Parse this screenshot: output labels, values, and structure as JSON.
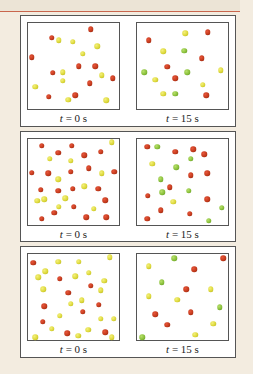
{
  "figure": {
    "rows": [
      {
        "left": {
          "label_var": "t",
          "label_rest": " = 0 s",
          "particles": [
            {
              "c": "red",
              "x": 69,
              "y": 7
            },
            {
              "c": "red",
              "x": 26,
              "y": 17
            },
            {
              "c": "yellow",
              "x": 34,
              "y": 20
            },
            {
              "c": "yellow",
              "x": 49,
              "y": 22
            },
            {
              "c": "yellow",
              "x": 76,
              "y": 27
            },
            {
              "c": "red",
              "x": 4,
              "y": 40
            },
            {
              "c": "yellow",
              "x": 60,
              "y": 36
            },
            {
              "c": "red",
              "x": 56,
              "y": 50
            },
            {
              "c": "red",
              "x": 74,
              "y": 50
            },
            {
              "c": "red",
              "x": 27,
              "y": 58
            },
            {
              "c": "yellow",
              "x": 38,
              "y": 57
            },
            {
              "c": "yellow",
              "x": 81,
              "y": 61
            },
            {
              "c": "red",
              "x": 93,
              "y": 64
            },
            {
              "c": "yellow",
              "x": 38,
              "y": 67
            },
            {
              "c": "yellow",
              "x": 8,
              "y": 74
            },
            {
              "c": "red",
              "x": 68,
              "y": 70
            },
            {
              "c": "red",
              "x": 23,
              "y": 86
            },
            {
              "c": "red",
              "x": 52,
              "y": 84
            },
            {
              "c": "yellow",
              "x": 44,
              "y": 89
            },
            {
              "c": "yellow",
              "x": 86,
              "y": 90
            }
          ]
        },
        "right": {
          "label_var": "t",
          "label_rest": " = 15 s",
          "particles": [
            {
              "c": "yellow",
              "x": 53,
              "y": 12
            },
            {
              "c": "red",
              "x": 78,
              "y": 11
            },
            {
              "c": "red",
              "x": 13,
              "y": 20
            },
            {
              "c": "yellow",
              "x": 29,
              "y": 33
            },
            {
              "c": "green",
              "x": 52,
              "y": 32
            },
            {
              "c": "red",
              "x": 71,
              "y": 41
            },
            {
              "c": "red",
              "x": 33,
              "y": 51
            },
            {
              "c": "green",
              "x": 8,
              "y": 57
            },
            {
              "c": "green",
              "x": 55,
              "y": 57
            },
            {
              "c": "yellow",
              "x": 92,
              "y": 55
            },
            {
              "c": "yellow",
              "x": 20,
              "y": 66
            },
            {
              "c": "red",
              "x": 42,
              "y": 64
            },
            {
              "c": "yellow",
              "x": 72,
              "y": 72
            },
            {
              "c": "yellow",
              "x": 29,
              "y": 82
            },
            {
              "c": "green",
              "x": 42,
              "y": 82
            },
            {
              "c": "red",
              "x": 76,
              "y": 84
            }
          ]
        }
      },
      {
        "left": {
          "label_var": "t",
          "label_rest": " = 0 s",
          "particles": [
            {
              "c": "red",
              "x": 15,
              "y": 8
            },
            {
              "c": "red",
              "x": 48,
              "y": 8
            },
            {
              "c": "yellow",
              "x": 92,
              "y": 4
            },
            {
              "c": "red",
              "x": 33,
              "y": 16
            },
            {
              "c": "red",
              "x": 62,
              "y": 19
            },
            {
              "c": "red",
              "x": 80,
              "y": 15
            },
            {
              "c": "yellow",
              "x": 24,
              "y": 23
            },
            {
              "c": "yellow",
              "x": 47,
              "y": 25
            },
            {
              "c": "red",
              "x": 4,
              "y": 39
            },
            {
              "c": "red",
              "x": 22,
              "y": 40
            },
            {
              "c": "red",
              "x": 67,
              "y": 34
            },
            {
              "c": "red",
              "x": 47,
              "y": 38
            },
            {
              "c": "red",
              "x": 95,
              "y": 38
            },
            {
              "c": "yellow",
              "x": 33,
              "y": 47
            },
            {
              "c": "yellow",
              "x": 81,
              "y": 40
            },
            {
              "c": "red",
              "x": 14,
              "y": 59
            },
            {
              "c": "red",
              "x": 33,
              "y": 60
            },
            {
              "c": "red",
              "x": 49,
              "y": 58
            },
            {
              "c": "yellow",
              "x": 62,
              "y": 55
            },
            {
              "c": "red",
              "x": 77,
              "y": 58
            },
            {
              "c": "yellow",
              "x": 10,
              "y": 72
            },
            {
              "c": "yellow",
              "x": 18,
              "y": 70
            },
            {
              "c": "yellow",
              "x": 41,
              "y": 69
            },
            {
              "c": "red",
              "x": 85,
              "y": 71
            },
            {
              "c": "yellow",
              "x": 34,
              "y": 79
            },
            {
              "c": "red",
              "x": 50,
              "y": 79
            },
            {
              "c": "red",
              "x": 29,
              "y": 86
            },
            {
              "c": "yellow",
              "x": 72,
              "y": 81
            },
            {
              "c": "red",
              "x": 15,
              "y": 93
            },
            {
              "c": "red",
              "x": 64,
              "y": 91
            },
            {
              "c": "red",
              "x": 86,
              "y": 91
            }
          ]
        },
        "right": {
          "label_var": "t",
          "label_rest": " = 15 s",
          "particles": [
            {
              "c": "red",
              "x": 11,
              "y": 9
            },
            {
              "c": "green",
              "x": 22,
              "y": 9
            },
            {
              "c": "red",
              "x": 42,
              "y": 15
            },
            {
              "c": "red",
              "x": 62,
              "y": 12
            },
            {
              "c": "red",
              "x": 74,
              "y": 18
            },
            {
              "c": "green",
              "x": 59,
              "y": 23
            },
            {
              "c": "yellow",
              "x": 17,
              "y": 29
            },
            {
              "c": "green",
              "x": 43,
              "y": 33
            },
            {
              "c": "red",
              "x": 59,
              "y": 42
            },
            {
              "c": "red",
              "x": 77,
              "y": 40
            },
            {
              "c": "green",
              "x": 26,
              "y": 47
            },
            {
              "c": "red",
              "x": 36,
              "y": 56
            },
            {
              "c": "red",
              "x": 12,
              "y": 66
            },
            {
              "c": "green",
              "x": 28,
              "y": 62
            },
            {
              "c": "green",
              "x": 57,
              "y": 60
            },
            {
              "c": "yellow",
              "x": 40,
              "y": 73
            },
            {
              "c": "red",
              "x": 77,
              "y": 70
            },
            {
              "c": "red",
              "x": 26,
              "y": 83
            },
            {
              "c": "green",
              "x": 93,
              "y": 80
            },
            {
              "c": "red",
              "x": 58,
              "y": 87
            },
            {
              "c": "red",
              "x": 11,
              "y": 93
            },
            {
              "c": "green",
              "x": 79,
              "y": 95
            }
          ]
        }
      },
      {
        "left": {
          "label_var": "t",
          "label_rest": " = 0 s",
          "particles": [
            {
              "c": "red",
              "x": 6,
              "y": 10
            },
            {
              "c": "yellow",
              "x": 33,
              "y": 9
            },
            {
              "c": "yellow",
              "x": 56,
              "y": 9
            },
            {
              "c": "yellow",
              "x": 90,
              "y": 4
            },
            {
              "c": "yellow",
              "x": 19,
              "y": 20
            },
            {
              "c": "yellow",
              "x": 11,
              "y": 27
            },
            {
              "c": "red",
              "x": 35,
              "y": 29
            },
            {
              "c": "yellow",
              "x": 52,
              "y": 26
            },
            {
              "c": "yellow",
              "x": 67,
              "y": 22
            },
            {
              "c": "yellow",
              "x": 84,
              "y": 31
            },
            {
              "c": "yellow",
              "x": 17,
              "y": 41
            },
            {
              "c": "red",
              "x": 44,
              "y": 45
            },
            {
              "c": "red",
              "x": 69,
              "y": 37
            },
            {
              "c": "yellow",
              "x": 80,
              "y": 42
            },
            {
              "c": "yellow",
              "x": 59,
              "y": 54
            },
            {
              "c": "red",
              "x": 18,
              "y": 61
            },
            {
              "c": "yellow",
              "x": 47,
              "y": 58
            },
            {
              "c": "red",
              "x": 78,
              "y": 59
            },
            {
              "c": "yellow",
              "x": 35,
              "y": 72
            },
            {
              "c": "red",
              "x": 60,
              "y": 67
            },
            {
              "c": "yellow",
              "x": 80,
              "y": 75
            },
            {
              "c": "yellow",
              "x": 94,
              "y": 75
            },
            {
              "c": "red",
              "x": 16,
              "y": 79
            },
            {
              "c": "yellow",
              "x": 26,
              "y": 87
            },
            {
              "c": "red",
              "x": 43,
              "y": 92
            },
            {
              "c": "yellow",
              "x": 66,
              "y": 88
            },
            {
              "c": "red",
              "x": 85,
              "y": 91
            },
            {
              "c": "yellow",
              "x": 8,
              "y": 97
            },
            {
              "c": "yellow",
              "x": 55,
              "y": 95
            },
            {
              "c": "yellow",
              "x": 92,
              "y": 100
            }
          ]
        },
        "right": {
          "label_var": "t",
          "label_rest": " = 15 s",
          "particles": [
            {
              "c": "green",
              "x": 41,
              "y": 5
            },
            {
              "c": "red",
              "x": 95,
              "y": 5
            },
            {
              "c": "yellow",
              "x": 13,
              "y": 14
            },
            {
              "c": "red",
              "x": 63,
              "y": 18
            },
            {
              "c": "green",
              "x": 27,
              "y": 33
            },
            {
              "c": "red",
              "x": 54,
              "y": 41
            },
            {
              "c": "yellow",
              "x": 81,
              "y": 41
            },
            {
              "c": "yellow",
              "x": 13,
              "y": 49
            },
            {
              "c": "yellow",
              "x": 44,
              "y": 53
            },
            {
              "c": "green",
              "x": 91,
              "y": 62
            },
            {
              "c": "red",
              "x": 20,
              "y": 70
            },
            {
              "c": "red",
              "x": 59,
              "y": 68
            },
            {
              "c": "red",
              "x": 33,
              "y": 82
            },
            {
              "c": "yellow",
              "x": 84,
              "y": 81
            },
            {
              "c": "yellow",
              "x": 64,
              "y": 94
            },
            {
              "c": "green",
              "x": 6,
              "y": 104
            }
          ]
        }
      }
    ]
  },
  "colors": {
    "red": "#c23a1c",
    "yellow": "#dcd83a",
    "green": "#88bf3a",
    "background": "#f3ece0",
    "rule": "#c9664d"
  }
}
